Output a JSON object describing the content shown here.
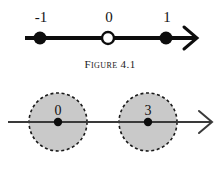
{
  "document": {
    "background_color": "#ffffff",
    "ink_color": "#111111"
  },
  "figures": [
    {
      "id": "figure-4-1",
      "caption": "Figure 4.1",
      "type": "number-line",
      "axis": {
        "y": 38,
        "x_start": 25,
        "x_end": 196,
        "stroke_color": "#0d0d0d",
        "stroke_width": 4,
        "arrow_at": "right"
      },
      "points": [
        {
          "label": "-1",
          "x": 40,
          "marker": "filled-dot",
          "radius": 6,
          "color": "#0d0d0d",
          "label_x": 41,
          "label_y": 10
        },
        {
          "label": "0",
          "x": 108,
          "marker": "open-dot",
          "radius": 6,
          "color": "#ffffff",
          "label_x": 109,
          "label_y": 10
        },
        {
          "label": "1",
          "x": 166,
          "marker": "filled-dot",
          "radius": 6,
          "color": "#0d0d0d",
          "label_x": 167,
          "label_y": 10
        }
      ]
    },
    {
      "id": "figure-4-2",
      "caption": "Figure 4.2",
      "type": "number-line-with-neighborhoods",
      "axis": {
        "y": 42,
        "x_start": 8,
        "x_end": 212,
        "stroke_color": "#3a3a3a",
        "stroke_width": 2,
        "arrow_at": "right"
      },
      "discs": [
        {
          "label": "0",
          "center_x": 58,
          "center_y": 42,
          "radius": 29,
          "fill_color": "#c9c9c9",
          "border_color": "#1a1a1a",
          "border_style": "dashed",
          "center_marker": "filled-dot",
          "center_marker_radius": 4,
          "label_x": 58,
          "label_y": 24
        },
        {
          "label": "3",
          "center_x": 148,
          "center_y": 42,
          "radius": 29,
          "fill_color": "#c9c9c9",
          "border_color": "#1a1a1a",
          "border_style": "dashed",
          "center_marker": "filled-dot",
          "center_marker_radius": 4,
          "label_x": 148,
          "label_y": 24
        }
      ]
    }
  ]
}
